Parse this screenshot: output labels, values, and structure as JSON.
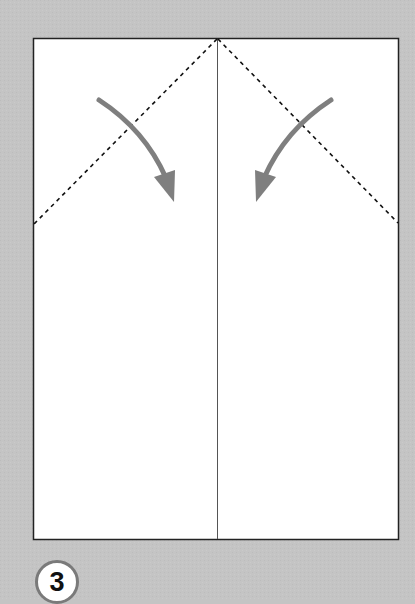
{
  "diagram": {
    "type": "origami-instruction",
    "step_number": "3",
    "colors": {
      "background": "#c4c4c4",
      "paper": "#ffffff",
      "arrow": "#7f7f7f",
      "dash_line": "#111111",
      "crease": "#555555"
    },
    "elements": [
      "paper-rectangle",
      "center-crease",
      "left-valley-fold-line",
      "right-valley-fold-line",
      "left-fold-arrow",
      "right-fold-arrow"
    ]
  }
}
